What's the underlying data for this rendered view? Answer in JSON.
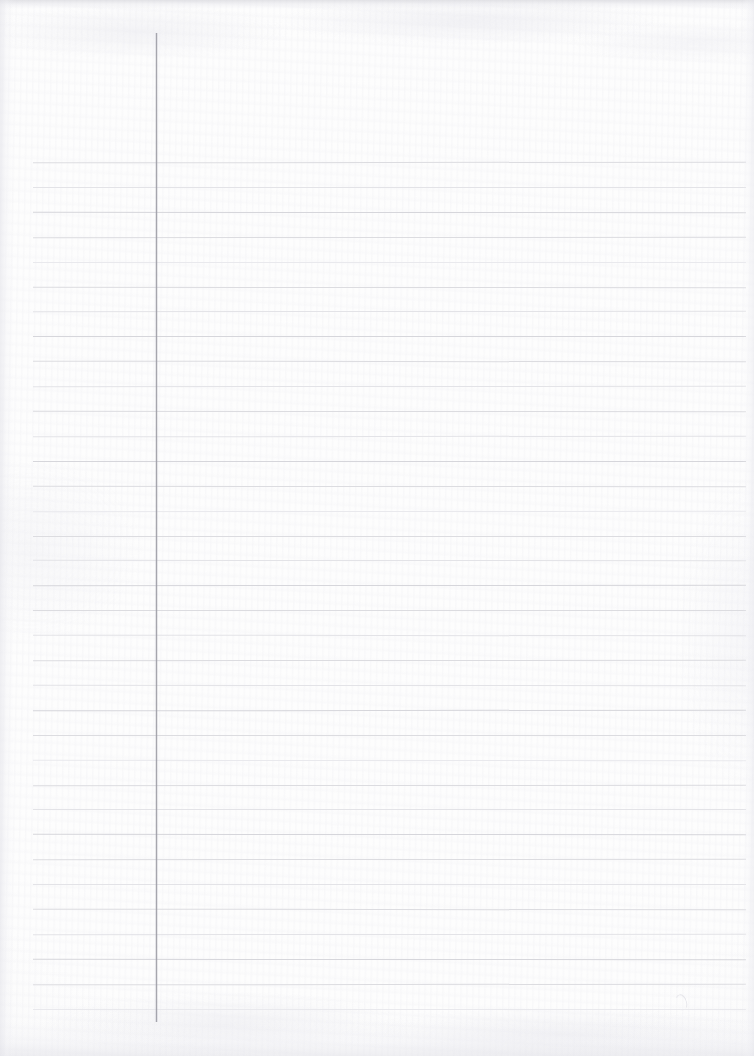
{
  "document": {
    "type": "scanned-lined-notebook-page",
    "title": "Blank ruled notebook page",
    "content_text": "",
    "page_width": 754,
    "page_height": 1056,
    "paper_color": "#fdfdfd",
    "has_handwriting": false,
    "has_printed_text": false
  },
  "ruling": {
    "style": "single-ruled-with-left-margin",
    "line_color": "#dcdce0",
    "line_count": 35,
    "first_line_y": 162,
    "line_spacing": 24.9,
    "line_start_x": 33,
    "line_end_x": 746,
    "line_thickness": 1
  },
  "margin_rule": {
    "name": "left vertical margin line",
    "color": "#9c9ca2",
    "x": 156,
    "top_y": 33,
    "bottom_y": 1022,
    "thickness": 1
  },
  "scan_artifacts": {
    "top_band_color": "#d2d2d8",
    "bottom_band_color": "#e2e2e8",
    "left_edge_shadow_color": "#e4e4ea",
    "right_edge_shadow_color": "#e6e6ec",
    "grain": "fine fibrous paper texture",
    "stray_marks": [
      {
        "name": "faint-pencil-loop",
        "x": 676,
        "y": 994,
        "width": 9,
        "height": 15
      }
    ]
  }
}
